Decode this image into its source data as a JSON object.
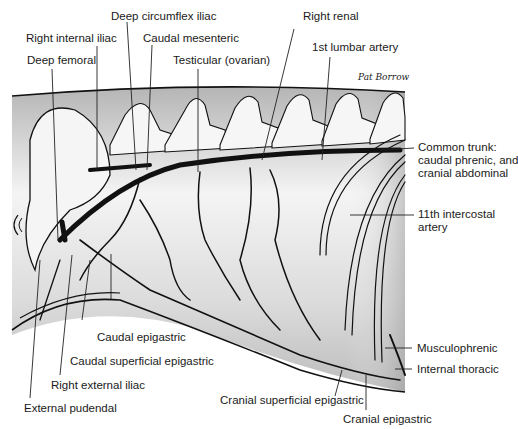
{
  "figure": {
    "signature": "Pat Borrow",
    "colors": {
      "background": "#ffffff",
      "body_shade": "#bdbdbd",
      "body_light": "#f2f2f2",
      "vessel": "#111111",
      "leader_line": "#222222"
    }
  },
  "labels": {
    "deep_circumflex_iliac": "Deep circumflex iliac",
    "right_renal": "Right renal",
    "right_internal_iliac": "Right internal iliac",
    "caudal_mesenteric": "Caudal mesenteric",
    "first_lumbar_artery": "1st lumbar artery",
    "deep_femoral": "Deep femoral",
    "testicular_ovarian": "Testicular (ovarian)",
    "common_trunk_line1": "Common trunk:",
    "common_trunk_line2": "caudal phrenic, and",
    "common_trunk_line3": "cranial abdominal",
    "eleventh_intercostal_line1": "11th intercostal",
    "eleventh_intercostal_line2": "artery",
    "caudal_epigastric": "Caudal epigastric",
    "caudal_superficial_epigastric": "Caudal superficial epigastric",
    "right_external_iliac": "Right external iliac",
    "external_pudendal": "External pudendal",
    "cranial_superficial_epigastric": "Cranial superficial epigastric",
    "cranial_epigastric": "Cranial epigastric",
    "musculophrenic": "Musculophrenic",
    "internal_thoracic": "Internal thoracic"
  }
}
